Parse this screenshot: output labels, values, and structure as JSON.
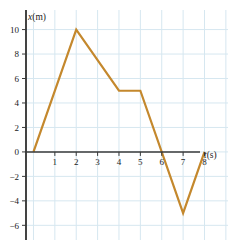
{
  "chart_data": {
    "type": "line",
    "title": "",
    "subtitle": "",
    "xlabel": "t(s)",
    "ylabel": "x(m)",
    "xlabel_var": "t",
    "xlabel_unit": "(s)",
    "ylabel_var": "x",
    "ylabel_unit": "(m)",
    "xlim": [
      -0.35,
      9.1
    ],
    "ylim": [
      -7.2,
      11.6
    ],
    "xticks": [
      1,
      2,
      3,
      4,
      5,
      6,
      7,
      8
    ],
    "xtick_labels": [
      "1",
      "2",
      "3",
      "4",
      "5",
      "6",
      "7",
      "8"
    ],
    "yticks": [
      -6,
      -4,
      -2,
      0,
      2,
      4,
      6,
      8,
      10
    ],
    "ytick_labels": [
      "−6",
      "−4",
      "−2",
      "0",
      "2",
      "4",
      "6",
      "8",
      "10"
    ],
    "grid": true,
    "grid_color": "#d6e7f0",
    "grid_x": [
      0,
      1,
      2,
      3,
      4,
      5,
      6,
      7,
      8,
      9
    ],
    "grid_y": [
      -6,
      -4,
      -2,
      0,
      2,
      4,
      6,
      8,
      10
    ],
    "axis_color": "#3a3a3a",
    "legend": null,
    "legend_position": "none",
    "series": [
      {
        "name": "position",
        "color": "#c4882d",
        "line_width": 2.2,
        "x": [
          0,
          2,
          4,
          5,
          7,
          8
        ],
        "values": [
          0,
          10,
          5,
          5,
          -5,
          0
        ],
        "points": [
          {
            "t": 0,
            "x": 0
          },
          {
            "t": 2,
            "x": 10
          },
          {
            "t": 4,
            "x": 5
          },
          {
            "t": 5,
            "x": 5
          },
          {
            "t": 7,
            "x": -5
          },
          {
            "t": 8,
            "x": 0
          }
        ]
      }
    ],
    "annotations": [],
    "zero_crossings": [
      0,
      6.2,
      8
    ]
  },
  "figure": {
    "background": "#ffffff",
    "width": 236,
    "height": 248
  }
}
